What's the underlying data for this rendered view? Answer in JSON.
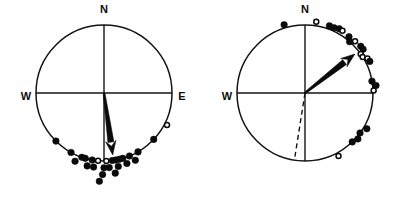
{
  "figure": {
    "background_color": "#ffffff",
    "ink_color": "#0a0a0a",
    "panel_count": 2
  },
  "chart_data": [
    {
      "type": "scatter",
      "subtype": "circular-orientation-plot",
      "panel_id": "left",
      "panel_label": "",
      "title": "",
      "xlabel": "",
      "ylabel": "",
      "center_x": 104,
      "center_y": 93,
      "radius": 68,
      "grid": false,
      "legend_position": "none",
      "axis_convention": "azimuth-degrees-clockwise-from-north",
      "ylim": [
        0,
        360
      ],
      "cardinal_labels": [
        {
          "text": "N",
          "azimuth": 0,
          "x": 104,
          "y": 10,
          "visible": true
        },
        {
          "text": "W",
          "azimuth": 270,
          "x": 26,
          "y": 97,
          "visible": true
        },
        {
          "text": "E",
          "azimuth": 90,
          "x": 182,
          "y": 97,
          "visible": true
        },
        {
          "text": "S",
          "azimuth": 180,
          "x": 104,
          "y": 178,
          "visible": false
        }
      ],
      "mean_vector": {
        "azimuth": 172,
        "length_fraction": 0.92,
        "style": "solid-wedge-arrow",
        "label": ""
      },
      "dashed_vector": null,
      "points": [
        {
          "azimuth": 117,
          "filled": false,
          "radius_factor": 1.04
        },
        {
          "azimuth": 133,
          "filled": true,
          "radius_factor": 1.0
        },
        {
          "azimuth": 150,
          "filled": true,
          "radius_factor": 1.0
        },
        {
          "azimuth": 155,
          "filled": true,
          "radius_factor": 1.09
        },
        {
          "azimuth": 158,
          "filled": true,
          "radius_factor": 1.0
        },
        {
          "azimuth": 162,
          "filled": true,
          "radius_factor": 1.09
        },
        {
          "azimuth": 164,
          "filled": true,
          "radius_factor": 1.0
        },
        {
          "azimuth": 167,
          "filled": true,
          "radius_factor": 1.0
        },
        {
          "azimuth": 169,
          "filled": true,
          "radius_factor": 1.1
        },
        {
          "azimuth": 170,
          "filled": true,
          "radius_factor": 1.0
        },
        {
          "azimuth": 172,
          "filled": true,
          "radius_factor": 1.19
        },
        {
          "azimuth": 173,
          "filled": true,
          "radius_factor": 1.0
        },
        {
          "azimuth": 176,
          "filled": true,
          "radius_factor": 1.1
        },
        {
          "azimuth": 178,
          "filled": false,
          "radius_factor": 1.0
        },
        {
          "azimuth": 180,
          "filled": true,
          "radius_factor": 1.1
        },
        {
          "azimuth": 181,
          "filled": true,
          "radius_factor": 1.2
        },
        {
          "azimuth": 183,
          "filled": true,
          "radius_factor": 1.3
        },
        {
          "azimuth": 185,
          "filled": false,
          "radius_factor": 1.0
        },
        {
          "azimuth": 188,
          "filled": true,
          "radius_factor": 1.1
        },
        {
          "azimuth": 190,
          "filled": true,
          "radius_factor": 1.0
        },
        {
          "azimuth": 193,
          "filled": true,
          "radius_factor": 1.1
        },
        {
          "azimuth": 196,
          "filled": true,
          "radius_factor": 1.0
        },
        {
          "azimuth": 199,
          "filled": true,
          "radius_factor": 1.0
        },
        {
          "azimuth": 203,
          "filled": true,
          "radius_factor": 1.09
        },
        {
          "azimuth": 209,
          "filled": true,
          "radius_factor": 1.0
        },
        {
          "azimuth": 225,
          "filled": true,
          "radius_factor": 1.0
        }
      ],
      "point_count": 26
    },
    {
      "type": "scatter",
      "subtype": "circular-orientation-plot",
      "panel_id": "right",
      "panel_label": "",
      "title": "",
      "xlabel": "",
      "ylabel": "",
      "center_x": 305,
      "center_y": 93,
      "radius": 68,
      "grid": false,
      "legend_position": "none",
      "axis_convention": "azimuth-degrees-clockwise-from-north",
      "ylim": [
        0,
        360
      ],
      "cardinal_labels": [
        {
          "text": "N",
          "azimuth": 0,
          "x": 305,
          "y": 10,
          "visible": true
        },
        {
          "text": "W",
          "azimuth": 270,
          "x": 227,
          "y": 97,
          "visible": true
        },
        {
          "text": "E",
          "azimuth": 90,
          "x": 383,
          "y": 97,
          "visible": false
        },
        {
          "text": "S",
          "azimuth": 180,
          "x": 305,
          "y": 178,
          "visible": false
        }
      ],
      "mean_vector": {
        "azimuth": 52,
        "length_fraction": 0.93,
        "style": "solid-wedge-arrow",
        "label": ""
      },
      "dashed_vector": {
        "azimuth": 189,
        "length_fraction": 0.97,
        "style": "dashed-line",
        "label": ""
      },
      "points": [
        {
          "azimuth": 343,
          "filled": true,
          "radius_factor": 1.05
        },
        {
          "azimuth": 9,
          "filled": false,
          "radius_factor": 1.06
        },
        {
          "azimuth": 20,
          "filled": true,
          "radius_factor": 1.05
        },
        {
          "azimuth": 24,
          "filled": true,
          "radius_factor": 1.05
        },
        {
          "azimuth": 28,
          "filled": true,
          "radius_factor": 1.07
        },
        {
          "azimuth": 31,
          "filled": false,
          "radius_factor": 1.07
        },
        {
          "azimuth": 38,
          "filled": true,
          "radius_factor": 1.05
        },
        {
          "azimuth": 41,
          "filled": true,
          "radius_factor": 1.0
        },
        {
          "azimuth": 44,
          "filled": false,
          "radius_factor": 1.06
        },
        {
          "azimuth": 50,
          "filled": true,
          "radius_factor": 1.07
        },
        {
          "azimuth": 53,
          "filled": true,
          "radius_factor": 1.07
        },
        {
          "azimuth": 55,
          "filled": false,
          "radius_factor": 1.0
        },
        {
          "azimuth": 58,
          "filled": false,
          "radius_factor": 1.0
        },
        {
          "azimuth": 61,
          "filled": false,
          "radius_factor": 1.05
        },
        {
          "azimuth": 64,
          "filled": true,
          "radius_factor": 1.06
        },
        {
          "azimuth": 80,
          "filled": true,
          "radius_factor": 1.0
        },
        {
          "azimuth": 84,
          "filled": true,
          "radius_factor": 1.05
        },
        {
          "azimuth": 88,
          "filled": false,
          "radius_factor": 1.01
        },
        {
          "azimuth": 120,
          "filled": true,
          "radius_factor": 1.05
        },
        {
          "azimuth": 126,
          "filled": true,
          "radius_factor": 1.0
        },
        {
          "azimuth": 131,
          "filled": true,
          "radius_factor": 1.03
        },
        {
          "azimuth": 136,
          "filled": true,
          "radius_factor": 1.0
        },
        {
          "azimuth": 152,
          "filled": false,
          "radius_factor": 1.05
        }
      ],
      "point_count": 23
    }
  ]
}
